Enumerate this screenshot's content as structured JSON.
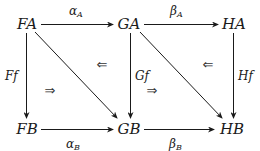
{
  "diagram": {
    "type": "commutative-diagram",
    "nodes": [
      {
        "id": "FA",
        "label": "FA",
        "x": 27,
        "y": 29
      },
      {
        "id": "GA",
        "label": "GA",
        "x": 129,
        "y": 29
      },
      {
        "id": "HA",
        "label": "HA",
        "x": 234,
        "y": 29
      },
      {
        "id": "FB",
        "label": "FB",
        "x": 27,
        "y": 134
      },
      {
        "id": "GB",
        "label": "GB",
        "x": 129,
        "y": 134
      },
      {
        "id": "HB",
        "label": "HB",
        "x": 232,
        "y": 134
      }
    ],
    "edges": [
      {
        "from": "FA",
        "to": "GA",
        "label": "α",
        "sub": "A"
      },
      {
        "from": "GA",
        "to": "HA",
        "label": "β",
        "sub": "A"
      },
      {
        "from": "FB",
        "to": "GB",
        "label": "α",
        "sub": "B"
      },
      {
        "from": "GB",
        "to": "HB",
        "label": "β",
        "sub": "B"
      },
      {
        "from": "FA",
        "to": "FB",
        "label": "Ff"
      },
      {
        "from": "GA",
        "to": "GB",
        "label": "Gf"
      },
      {
        "from": "HA",
        "to": "HB",
        "label": "Hf"
      },
      {
        "from": "FA",
        "to": "GB",
        "label": ""
      },
      {
        "from": "GA",
        "to": "HB",
        "label": ""
      }
    ],
    "two_cells": [
      {
        "symbol": "⇐",
        "x": 102,
        "y": 69
      },
      {
        "symbol": "⇒",
        "x": 50,
        "y": 95
      },
      {
        "symbol": "⇐",
        "x": 208,
        "y": 69
      },
      {
        "symbol": "⇒",
        "x": 152,
        "y": 95
      }
    ]
  }
}
